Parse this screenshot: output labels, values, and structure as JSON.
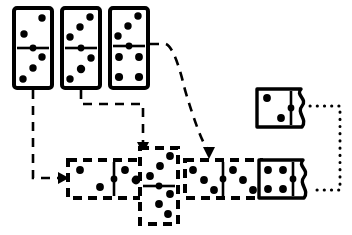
{
  "diagram": {
    "title": "Domino tile matching diagram",
    "type": "domino-flow-diagram",
    "background_color": "#ffffff",
    "ink_color": "#000000",
    "canvas": {
      "width": 352,
      "height": 235
    },
    "dominoes": [
      {
        "id": "source-domino-1",
        "label": "source domino 1",
        "orientation": "vertical",
        "border_style": "solid",
        "edge_right": "straight",
        "x": 14,
        "y": 8,
        "w": 38,
        "h": 80,
        "halves": [
          {
            "position": "top",
            "pips": 2,
            "pattern": "diagonal-2"
          },
          {
            "position": "bottom",
            "pips": 3,
            "pattern": "diagonal-3"
          }
        ]
      },
      {
        "id": "source-domino-2",
        "label": "source domino 2",
        "orientation": "vertical",
        "border_style": "solid",
        "edge_right": "straight",
        "x": 62,
        "y": 8,
        "w": 38,
        "h": 80,
        "halves": [
          {
            "position": "top",
            "pips": 3,
            "pattern": "diagonal-3"
          },
          {
            "position": "bottom",
            "pips": 3,
            "pattern": "diagonal-3"
          }
        ]
      },
      {
        "id": "source-domino-3",
        "label": "source domino 3",
        "orientation": "vertical",
        "border_style": "solid",
        "edge_right": "straight",
        "x": 110,
        "y": 8,
        "w": 38,
        "h": 80,
        "halves": [
          {
            "position": "top",
            "pips": 3,
            "pattern": "diagonal-3"
          },
          {
            "position": "bottom",
            "pips": 4,
            "pattern": "square-4"
          }
        ]
      },
      {
        "id": "chain-domino-left",
        "label": "chain domino horizontal left",
        "orientation": "horizontal",
        "border_style": "dashed",
        "edge_right": "straight",
        "x": 68,
        "y": 160,
        "w": 78,
        "h": 38,
        "halves": [
          {
            "position": "left",
            "pips": 2,
            "pattern": "diagonal-2"
          },
          {
            "position": "right",
            "pips": 3,
            "pattern": "diagonal-3"
          }
        ]
      },
      {
        "id": "chain-domino-vertical",
        "label": "chain domino vertical",
        "orientation": "vertical",
        "border_style": "dashed",
        "edge_right": "straight",
        "x": 140,
        "y": 148,
        "w": 38,
        "h": 76,
        "halves": [
          {
            "position": "top",
            "pips": 3,
            "pattern": "diagonal-3"
          },
          {
            "position": "bottom",
            "pips": 3,
            "pattern": "diagonal-3"
          }
        ]
      },
      {
        "id": "chain-domino-right-dashed",
        "label": "chain domino horizontal right dashed",
        "orientation": "horizontal",
        "border_style": "dashed",
        "edge_right": "straight",
        "x": 185,
        "y": 160,
        "w": 76,
        "h": 38,
        "halves": [
          {
            "position": "left",
            "pips": 3,
            "pattern": "diagonal-3"
          },
          {
            "position": "right",
            "pips": 3,
            "pattern": "diagonal-3"
          }
        ]
      },
      {
        "id": "torn-domino-bottom",
        "label": "torn domino bottom right",
        "orientation": "horizontal",
        "border_style": "solid",
        "edge_right": "torn-wavy",
        "x": 259,
        "y": 160,
        "w": 52,
        "h": 38,
        "halves": [
          {
            "position": "left",
            "pips": 4,
            "pattern": "square-4"
          }
        ]
      },
      {
        "id": "torn-domino-top",
        "label": "torn domino top right",
        "orientation": "horizontal",
        "border_style": "solid",
        "edge_right": "torn-wavy",
        "x": 257,
        "y": 89,
        "w": 52,
        "h": 38,
        "halves": [
          {
            "position": "left",
            "pips": 2,
            "pattern": "diagonal-2"
          }
        ]
      }
    ],
    "connectors": [
      {
        "id": "arrow-from-domino-1",
        "label": "dashed arrow from source domino 1 to chain left",
        "style": "dashed",
        "arrowhead": "right",
        "from": "source-domino-1",
        "to": "chain-domino-left"
      },
      {
        "id": "arrow-from-domino-2",
        "label": "dashed arrow from source domino 2 to chain vertical",
        "style": "dashed",
        "arrowhead": "down",
        "from": "source-domino-2",
        "to": "chain-domino-vertical"
      },
      {
        "id": "arrow-from-domino-3",
        "label": "dashed arrow from source domino 3 to chain right",
        "style": "dashed",
        "arrowhead": "down",
        "from": "source-domino-3",
        "to": "chain-domino-right-dashed"
      },
      {
        "id": "dotted-link-torn-dominoes",
        "label": "dotted connector linking torn domino edges",
        "style": "dotted",
        "arrowhead": "none",
        "from": "torn-domino-top",
        "to": "torn-domino-bottom"
      }
    ]
  }
}
